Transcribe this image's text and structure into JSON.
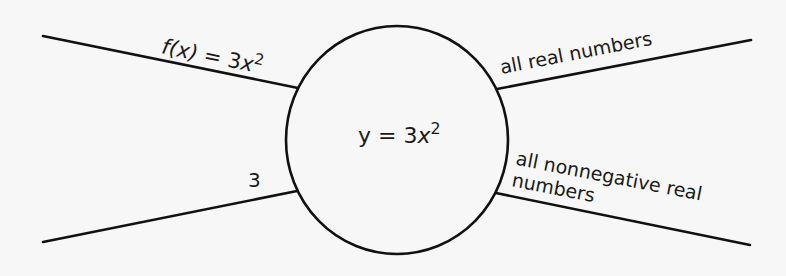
{
  "diagram": {
    "type": "function-machine",
    "center": {
      "lhs": "y",
      "eq": " = 3",
      "var": "x",
      "exp": "2"
    },
    "inputs": {
      "rule": {
        "func": "f(x)",
        "eq": " = 3",
        "var": "x",
        "exp": "2"
      },
      "value": "3"
    },
    "outputs": {
      "domain": "all real numbers",
      "range_line1": "all nonnegative real",
      "range_line2": "numbers"
    },
    "colors": {
      "stroke": "#111111",
      "background": "#f6f7f6",
      "text": "#1a1a1a"
    },
    "geometry": {
      "circle": {
        "cx": 397,
        "cy": 140,
        "rx": 111,
        "ry": 114
      },
      "lines": [
        {
          "name": "upper-left",
          "x1": 43,
          "y1": 36,
          "x2": 298,
          "y2": 88
        },
        {
          "name": "lower-left",
          "x1": 43,
          "y1": 242,
          "x2": 297,
          "y2": 191
        },
        {
          "name": "upper-right",
          "x1": 497,
          "y1": 89,
          "x2": 751,
          "y2": 40
        },
        {
          "name": "lower-right",
          "x1": 496,
          "y1": 193,
          "x2": 750,
          "y2": 245
        }
      ]
    }
  }
}
